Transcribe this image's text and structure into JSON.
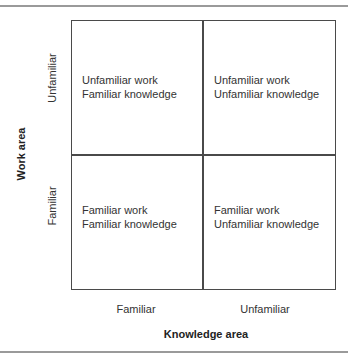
{
  "diagram": {
    "type": "2x2 matrix",
    "y_axis": {
      "title": "Work area",
      "labels": [
        "Unfamiliar",
        "Familiar"
      ]
    },
    "x_axis": {
      "title": "Knowledge area",
      "labels": [
        "Familiar",
        "Unfamiliar"
      ]
    },
    "cells": [
      {
        "line1": "Unfamiliar work",
        "line2": "Familiar knowledge"
      },
      {
        "line1": "Unfamiliar work",
        "line2": "Unfamiliar knowledge"
      },
      {
        "line1": "Familiar work",
        "line2": "Familiar knowledge"
      },
      {
        "line1": "Familiar work",
        "line2": "Unfamiliar knowledge"
      }
    ]
  }
}
